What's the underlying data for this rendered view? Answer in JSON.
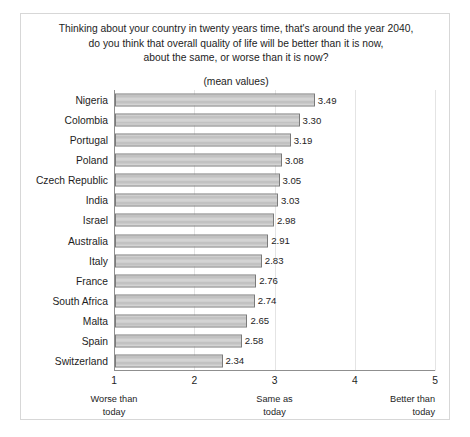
{
  "chart_data": {
    "type": "bar",
    "orientation": "horizontal",
    "title": "Thinking about your country in twenty years time, that's around the year 2040, do you think that overall quality of life will be better than it is now, about the same, or worse than it is now?",
    "title_lines": [
      "Thinking about your country in twenty years time, that's around the year 2040,",
      "do you think that overall quality of life will be better than it is now,",
      "about the same, or worse than it is now?"
    ],
    "subtitle": "(mean values)",
    "xlabel": "",
    "ylabel": "",
    "xlim": [
      1,
      5
    ],
    "xticks": [
      "1",
      "2",
      "3",
      "4",
      "5"
    ],
    "xtick_values": [
      1,
      2,
      3,
      4,
      5
    ],
    "grid": true,
    "legend": false,
    "scale_anchors": [
      {
        "value": 1,
        "lines": [
          "Worse than",
          "today"
        ],
        "align": "center"
      },
      {
        "value": 3,
        "lines": [
          "Same as",
          "today"
        ],
        "align": "center"
      },
      {
        "value": 5,
        "lines": [
          "Better than",
          "today"
        ],
        "align": "right"
      }
    ],
    "categories": [
      "Nigeria",
      "Colombia",
      "Portugal",
      "Poland",
      "Czech Republic",
      "India",
      "Israel",
      "Australia",
      "Italy",
      "France",
      "South Africa",
      "Malta",
      "Spain",
      "Switzerland"
    ],
    "values": [
      3.49,
      3.3,
      3.19,
      3.08,
      3.05,
      3.03,
      2.98,
      2.91,
      2.83,
      2.76,
      2.74,
      2.65,
      2.58,
      2.34
    ],
    "value_labels": [
      "3.49",
      "3.30",
      "3.19",
      "3.08",
      "3.05",
      "3.03",
      "2.98",
      "2.91",
      "2.83",
      "2.76",
      "2.74",
      "2.65",
      "2.58",
      "2.34"
    ],
    "colors": {
      "bar_fill": "#c8c8c8",
      "bar_border": "#7a7a7a",
      "gridline": "#e4e4e4",
      "axis": "#8f8f8f",
      "frame": "#d7d7d7",
      "text": "#1d1d1d"
    }
  }
}
